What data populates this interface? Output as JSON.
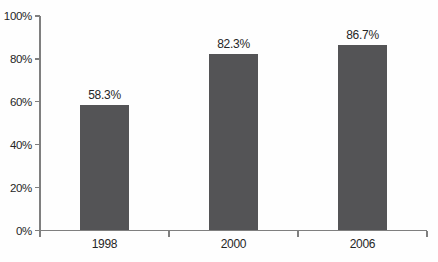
{
  "chart_data": {
    "type": "bar",
    "title": "",
    "xlabel": "",
    "ylabel": "",
    "categories": [
      "1998",
      "2000",
      "2006"
    ],
    "values": [
      58.3,
      82.3,
      86.7
    ],
    "value_labels": [
      "58.3%",
      "82.3%",
      "86.7%"
    ],
    "ylim": [
      0,
      100
    ],
    "yticks": [
      0,
      20,
      40,
      60,
      80,
      100
    ],
    "ytick_labels": [
      "0%",
      "20%",
      "40%",
      "60%",
      "80%",
      "100%"
    ],
    "grid": false,
    "legend": null,
    "colors": {
      "bar": "#545456",
      "axis": "#7f7f7f",
      "text": "#262626",
      "background": "#fefefe"
    }
  }
}
